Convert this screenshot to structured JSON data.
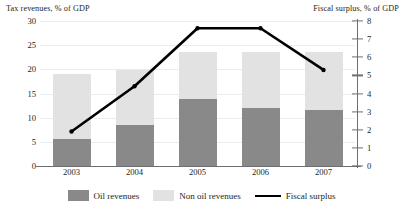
{
  "chart_data": {
    "type": "bar",
    "title": "",
    "categories": [
      "2003",
      "2004",
      "2005",
      "2006",
      "2007"
    ],
    "left_axis": {
      "label": "Tax revenues, % of GDP",
      "ticks": [
        0,
        5,
        10,
        15,
        20,
        25,
        30
      ],
      "ylim": [
        0,
        30
      ]
    },
    "right_axis": {
      "label": "Fiscal surplus, % of GDP",
      "ticks": [
        0,
        1,
        2,
        3,
        4,
        5,
        6,
        7,
        8
      ],
      "ylim": [
        0,
        8
      ]
    },
    "series": [
      {
        "name": "Oil revenues",
        "type": "bar",
        "stack": "revenues",
        "axis": "left",
        "color": "#898989",
        "values": [
          5.6,
          8.4,
          13.9,
          12.0,
          11.6
        ]
      },
      {
        "name": "Non oil revenues",
        "type": "bar",
        "stack": "revenues",
        "axis": "left",
        "color": "#e2e2e2",
        "values": [
          13.4,
          11.5,
          9.6,
          11.5,
          11.9
        ]
      },
      {
        "name": "Fiscal surplus",
        "type": "line",
        "axis": "right",
        "color": "#000000",
        "values": [
          1.9,
          4.4,
          7.6,
          7.6,
          5.3
        ]
      }
    ],
    "totals": [
      19.0,
      19.9,
      23.5,
      23.5,
      23.5
    ],
    "grid": true,
    "legend_position": "bottom"
  },
  "legend": {
    "items": [
      {
        "label": "Oil revenues",
        "swatch": "oil"
      },
      {
        "label": "Non oil revenues",
        "swatch": "nonoil"
      },
      {
        "label": "Fiscal surplus",
        "swatch": "line"
      }
    ]
  }
}
